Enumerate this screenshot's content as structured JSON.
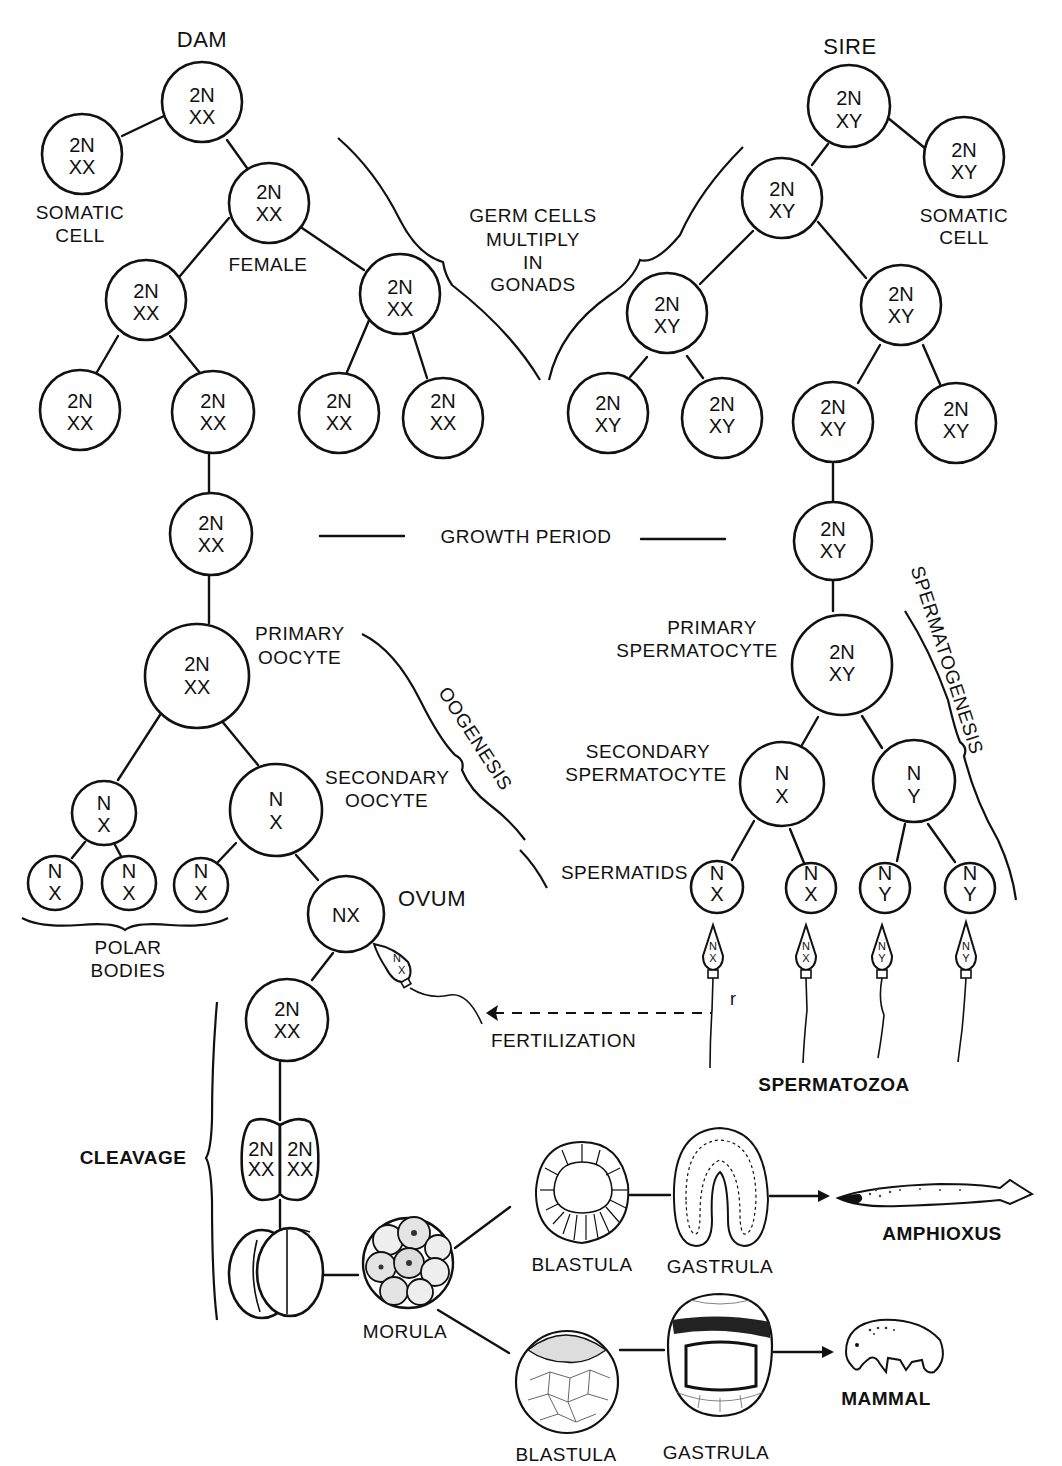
{
  "header_fragment": "",
  "parents": {
    "dam": "DAM",
    "sire": "SIRE"
  },
  "labels": {
    "somatic_cell_left_1": "SOMATIC",
    "somatic_cell_left_2": "CELL",
    "somatic_cell_right_1": "SOMATIC",
    "somatic_cell_right_2": "CELL",
    "female": "FEMALE",
    "germ_1": "GERM CELLS",
    "germ_2": "MULTIPLY",
    "germ_3": "IN",
    "germ_4": "GONADS",
    "growth_period": "GROWTH PERIOD",
    "primary_oocyte_1": "PRIMARY",
    "primary_oocyte_2": "OOCYTE",
    "secondary_oocyte_1": "SECONDARY",
    "secondary_oocyte_2": "OOCYTE",
    "oogenesis": "OOGENESIS",
    "ovum": "OVUM",
    "polar_bodies_1": "POLAR",
    "polar_bodies_2": "BODIES",
    "primary_spermatocyte_1": "PRIMARY",
    "primary_spermatocyte_2": "SPERMATOCYTE",
    "secondary_spermatocyte_1": "SECONDARY",
    "secondary_spermatocyte_2": "SPERMATOCYTE",
    "spermatogenesis": "SPERMATOGENESIS",
    "spermatids": "SPERMATIDS",
    "spermatozoa": "SPERMATOZOA",
    "stray_mark": "r",
    "fertilization": "FERTILIZATION",
    "cleavage": "CLEAVAGE",
    "morula": "MORULA",
    "blastula_top": "BLASTULA",
    "gastrula_top": "GASTRULA",
    "amphioxus": "AMPHIOXUS",
    "blastula_bottom": "BLASTULA",
    "gastrula_bottom": "GASTRULA",
    "mammal": "MAMMAL"
  },
  "dam_cells": {
    "root": {
      "l1": "2N",
      "l2": "XX"
    },
    "somatic": {
      "l1": "2N",
      "l2": "XX"
    },
    "female": {
      "l1": "2N",
      "l2": "XX"
    },
    "g2_left": {
      "l1": "2N",
      "l2": "XX"
    },
    "g2_right": {
      "l1": "2N",
      "l2": "XX"
    },
    "g3_a": {
      "l1": "2N",
      "l2": "XX"
    },
    "g3_b": {
      "l1": "2N",
      "l2": "XX"
    },
    "g3_c": {
      "l1": "2N",
      "l2": "XX"
    },
    "g3_d": {
      "l1": "2N",
      "l2": "XX"
    },
    "growth": {
      "l1": "2N",
      "l2": "XX"
    },
    "primary_oocyte": {
      "l1": "2N",
      "l2": "XX"
    },
    "first_polar": {
      "l1": "N",
      "l2": "X"
    },
    "secondary_oocyte": {
      "l1": "N",
      "l2": "X"
    },
    "polar_a": {
      "l1": "N",
      "l2": "X"
    },
    "polar_b": {
      "l1": "N",
      "l2": "X"
    },
    "polar_c": {
      "l1": "N",
      "l2": "X"
    },
    "ovum": {
      "l1": "NX"
    },
    "zygote": {
      "l1": "2N",
      "l2": "XX"
    },
    "two_cell_left": {
      "l1": "2N",
      "l2": "XX"
    },
    "two_cell_right": {
      "l1": "2N",
      "l2": "XX"
    }
  },
  "sire_cells": {
    "root": {
      "l1": "2N",
      "l2": "XY"
    },
    "somatic": {
      "l1": "2N",
      "l2": "XY"
    },
    "g1": {
      "l1": "2N",
      "l2": "XY"
    },
    "g2_left": {
      "l1": "2N",
      "l2": "XY"
    },
    "g2_right": {
      "l1": "2N",
      "l2": "XY"
    },
    "g3_a": {
      "l1": "2N",
      "l2": "XY"
    },
    "g3_b": {
      "l1": "2N",
      "l2": "XY"
    },
    "g3_c": {
      "l1": "2N",
      "l2": "XY"
    },
    "g3_d": {
      "l1": "2N",
      "l2": "XY"
    },
    "growth": {
      "l1": "2N",
      "l2": "XY"
    },
    "primary_spermatocyte": {
      "l1": "2N",
      "l2": "XY"
    },
    "secondary_x": {
      "l1": "N",
      "l2": "X"
    },
    "secondary_y": {
      "l1": "N",
      "l2": "Y"
    },
    "spermatid_1": {
      "l1": "N",
      "l2": "X"
    },
    "spermatid_2": {
      "l1": "N",
      "l2": "X"
    },
    "spermatid_3": {
      "l1": "N",
      "l2": "Y"
    },
    "spermatid_4": {
      "l1": "N",
      "l2": "Y"
    }
  },
  "spermatozoa": [
    {
      "l1": "N",
      "l2": "X"
    },
    {
      "l1": "N",
      "l2": "X"
    },
    {
      "l1": "N",
      "l2": "Y"
    },
    {
      "l1": "N",
      "l2": "Y"
    }
  ],
  "fertilizing_sperm": {
    "l1": "N",
    "l2": "X"
  }
}
